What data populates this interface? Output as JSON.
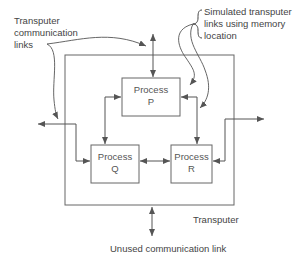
{
  "labels": {
    "transputer_links": [
      "Transputer",
      "communication",
      "links"
    ],
    "simulated_links": [
      "Simulated transputer",
      "links using memory",
      "location"
    ],
    "transputer": "Transputer",
    "unused_link": "Unused communication link"
  },
  "processes": [
    {
      "id": "P",
      "line1": "Process",
      "line2": "P"
    },
    {
      "id": "Q",
      "line1": "Process",
      "line2": "Q"
    },
    {
      "id": "R",
      "line1": "Process",
      "line2": "R"
    }
  ],
  "colors": {
    "line": "#555555",
    "text": "#444444"
  }
}
